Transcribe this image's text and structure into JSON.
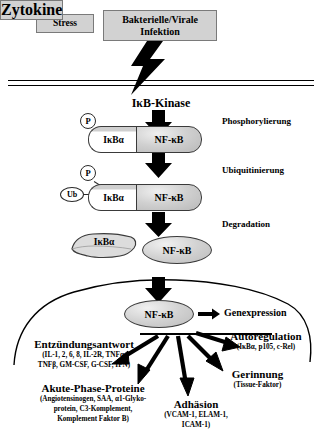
{
  "diagram": {
    "stimuli": [
      {
        "id": "stress",
        "label": "Stress"
      },
      {
        "id": "infektion",
        "label": "Bakterielle/Virale Infektion"
      },
      {
        "id": "zytokine",
        "label": "Zytokine"
      }
    ],
    "kinase": {
      "label": "IκB-Kinase"
    },
    "processes": [
      {
        "id": "phosphorylierung",
        "label": "Phosphorylierung"
      },
      {
        "id": "ubiquitinierung",
        "label": "Ubiquitinierung"
      },
      {
        "id": "degradation",
        "label": "Degradation"
      }
    ],
    "complexes": {
      "inhibitor_label": "IκBα",
      "nfkb_label": "NF-κB",
      "phospho_tag": "P",
      "ubiquitin_tag": "Ub"
    },
    "free_inhibitor": {
      "label": "IκBα"
    },
    "nucleus": {
      "nfkb_label": "NF-κB",
      "gene_expression_label": "Genexpression"
    },
    "effects": [
      {
        "id": "entzuendungsantwort",
        "title": "Entzündungsantwort",
        "details": [
          "(IL-1, 2, 6, 8, IL-2R, TNFα,",
          "TNFβ, GM-CSF, G-CSF, IFN)"
        ]
      },
      {
        "id": "akute-phase-proteine",
        "title": "Akute-Phase-Proteine",
        "details": [
          "(Angiotensinogen, SAA, α1-Glyko-",
          "protein, C3-Komplement,",
          "Komplement Faktor B)"
        ]
      },
      {
        "id": "adhaesion",
        "title": "Adhäsion",
        "details": [
          "(VCAM-1, ELAM-1,",
          "ICAM-1)"
        ]
      },
      {
        "id": "gerinnung",
        "title": "Gerinnung",
        "details": [
          "(Tissue-Faktor)"
        ]
      },
      {
        "id": "autoregulation",
        "title": "Autoregulation",
        "details": [
          "(IκBα, p105, c-Rel)"
        ]
      }
    ],
    "colors": {
      "box_fill": "#d2d2d2",
      "box_border": "#7a7a7a",
      "nfkb_fill": "#d0d0d0",
      "outline": "#3a3a3a",
      "arrow": "#000000"
    }
  }
}
